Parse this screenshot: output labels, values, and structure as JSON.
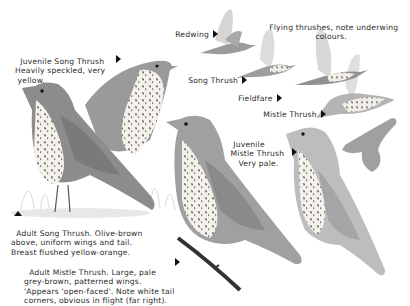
{
  "plate": {
    "flying_header": "Flying thrushes, note underwing\ncolours.",
    "flying_labels": [
      {
        "name": "Redwing"
      },
      {
        "name": "Song Thrush"
      },
      {
        "name": "Fieldfare"
      },
      {
        "name": "Mistle Thrush"
      }
    ],
    "juvenile_song_thrush": "Juvenile Song Thrush\nHeavily speckled, very\n yellow.",
    "adult_song_thrush": "Adult Song Thrush. Olive-brown\nabove, uniform wings and tail.\nBreast flushed yellow-orange.",
    "adult_mistle_thrush": "Adult Mistle Thrush. Large, pale\ngrey-brown, patterned wings.\n'Appears 'open-faced'. Note white tail\ncorners, obvious in flight (far right).",
    "juvenile_mistle_thrush": "Juvenile\n Mistle Thrush\n    Very pale."
  }
}
